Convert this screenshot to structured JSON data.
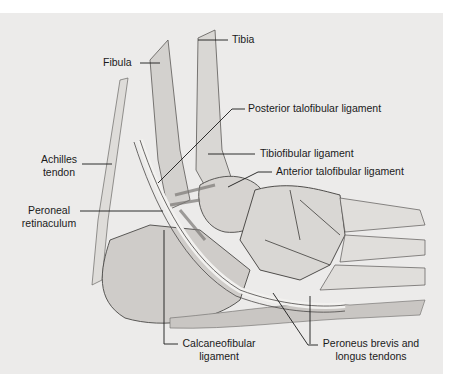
{
  "figure": {
    "style": "grayscale pencil illustration",
    "colors": {
      "background": "#ecebea",
      "outer": "#ffffff",
      "ink": "#1a1a1a",
      "bone": "#d6d4d1",
      "shadow": "#8a8784"
    }
  },
  "labels": {
    "tibia": "Tibia",
    "fibula": "Fibula",
    "posterior_talofibular": "Posterior talofibular ligament",
    "tibiofibular": "Tibiofibular ligament",
    "anterior_talofibular": "Anterior talofibular ligament",
    "achilles_line1": "Achilles",
    "achilles_line2": "tendon",
    "peroneal_line1": "Peroneal",
    "peroneal_line2": "retinaculum",
    "calcaneofibular_line1": "Calcaneofibular",
    "calcaneofibular_line2": "ligament",
    "peroneus_line1": "Peroneus brevis and",
    "peroneus_line2": "longus tendons"
  }
}
